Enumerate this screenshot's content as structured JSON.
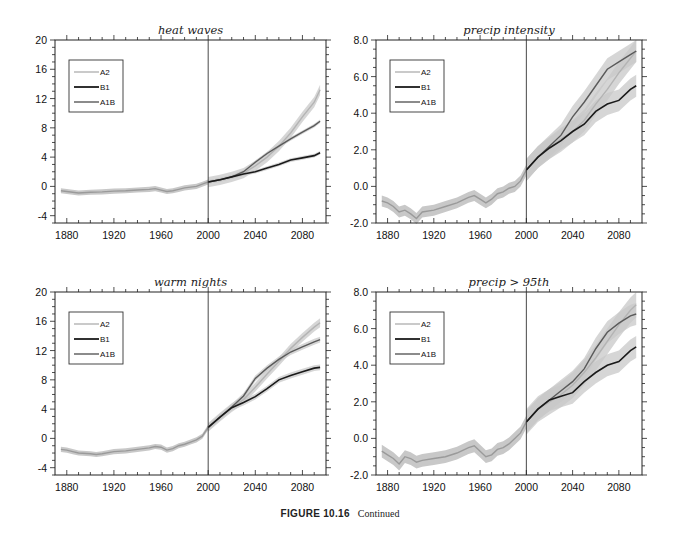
{
  "figure": {
    "caption_label": "FIGURE 10.16",
    "caption_text": "Continued"
  },
  "colors": {
    "A2": "#b4b4b4",
    "B1": "#1a1a1a",
    "A1B": "#5a5a5a",
    "historical": "#9a9a9a",
    "band": "#c8c8c8",
    "axis": "#222222"
  },
  "chart_data": [
    {
      "type": "line",
      "title": "heat waves",
      "xlabel": "",
      "ylabel": "",
      "xlim": [
        1870,
        2100
      ],
      "ylim": [
        -5,
        20
      ],
      "xticks": [
        1880,
        1920,
        1960,
        2000,
        2040,
        2080
      ],
      "yticks": [
        -4,
        0,
        4,
        8,
        12,
        16,
        20
      ],
      "ytick_labels": [
        "-4",
        "0",
        "4",
        "8",
        "12",
        "16",
        "20"
      ],
      "vline": 2000,
      "legend": [
        "A2",
        "B1",
        "A1B"
      ],
      "legend_position": "upper left",
      "band_width": 0.35,
      "historical": {
        "x": [
          1875,
          1880,
          1885,
          1890,
          1900,
          1910,
          1920,
          1930,
          1940,
          1950,
          1955,
          1960,
          1965,
          1970,
          1975,
          1980,
          1985,
          1990,
          1995,
          2000
        ],
        "y": [
          -0.6,
          -0.7,
          -0.8,
          -0.9,
          -0.8,
          -0.75,
          -0.65,
          -0.6,
          -0.5,
          -0.4,
          -0.3,
          -0.5,
          -0.7,
          -0.6,
          -0.4,
          -0.2,
          -0.1,
          0.0,
          0.3,
          0.6
        ]
      },
      "series": [
        {
          "name": "A2",
          "x": [
            2000,
            2010,
            2020,
            2030,
            2040,
            2050,
            2060,
            2070,
            2080,
            2090,
            2095
          ],
          "y": [
            0.6,
            0.9,
            1.3,
            1.8,
            2.8,
            4.0,
            5.5,
            7.3,
            9.5,
            11.5,
            13.2
          ],
          "band": 0.7
        },
        {
          "name": "B1",
          "x": [
            2000,
            2010,
            2020,
            2030,
            2040,
            2050,
            2060,
            2070,
            2080,
            2090,
            2095
          ],
          "y": [
            0.6,
            0.9,
            1.3,
            1.7,
            2.0,
            2.5,
            3.0,
            3.6,
            3.9,
            4.2,
            4.6
          ],
          "band": 0.25
        },
        {
          "name": "A1B",
          "x": [
            2000,
            2010,
            2020,
            2030,
            2040,
            2050,
            2060,
            2070,
            2080,
            2090,
            2095
          ],
          "y": [
            0.6,
            0.9,
            1.3,
            2.0,
            3.3,
            4.5,
            5.5,
            6.5,
            7.4,
            8.3,
            8.9
          ],
          "band": 0.25
        }
      ]
    },
    {
      "type": "line",
      "title": "precip intensity",
      "xlabel": "",
      "ylabel": "",
      "xlim": [
        1870,
        2100
      ],
      "ylim": [
        -2,
        8
      ],
      "xticks": [
        1880,
        1920,
        1960,
        2000,
        2040,
        2080
      ],
      "yticks": [
        -2,
        0,
        2,
        4,
        6,
        8
      ],
      "ytick_labels": [
        "-2.0",
        "0.0",
        "2.0",
        "4.0",
        "6.0",
        "8.0"
      ],
      "vline": 2000,
      "legend": [
        "A2",
        "B1",
        "A1B"
      ],
      "legend_position": "upper left",
      "band_width": 0.3,
      "historical": {
        "x": [
          1875,
          1880,
          1885,
          1890,
          1895,
          1900,
          1905,
          1910,
          1920,
          1930,
          1940,
          1950,
          1955,
          1960,
          1965,
          1970,
          1975,
          1980,
          1985,
          1990,
          1995,
          2000
        ],
        "y": [
          -0.8,
          -0.9,
          -1.1,
          -1.4,
          -1.3,
          -1.5,
          -1.75,
          -1.4,
          -1.3,
          -1.1,
          -0.9,
          -0.6,
          -0.5,
          -0.7,
          -0.9,
          -0.7,
          -0.4,
          -0.3,
          -0.1,
          0.0,
          0.3,
          0.9
        ]
      },
      "series": [
        {
          "name": "A2",
          "x": [
            2000,
            2010,
            2020,
            2030,
            2040,
            2050,
            2060,
            2070,
            2080,
            2090,
            2095
          ],
          "y": [
            0.9,
            1.6,
            2.1,
            2.6,
            3.0,
            3.6,
            4.5,
            5.3,
            6.2,
            7.0,
            7.4
          ],
          "band": 0.6
        },
        {
          "name": "B1",
          "x": [
            2000,
            2010,
            2020,
            2030,
            2040,
            2050,
            2060,
            2070,
            2080,
            2090,
            2095
          ],
          "y": [
            0.9,
            1.6,
            2.1,
            2.5,
            3.0,
            3.4,
            4.1,
            4.5,
            4.7,
            5.3,
            5.5
          ],
          "band": 0.6
        },
        {
          "name": "A1B",
          "x": [
            2000,
            2010,
            2020,
            2030,
            2040,
            2050,
            2060,
            2070,
            2080,
            2090,
            2095
          ],
          "y": [
            0.9,
            1.6,
            2.2,
            2.8,
            3.8,
            4.6,
            5.5,
            6.4,
            6.8,
            7.2,
            7.4
          ],
          "band": 0.6
        }
      ]
    },
    {
      "type": "line",
      "title": "warm nights",
      "xlabel": "",
      "ylabel": "",
      "xlim": [
        1870,
        2100
      ],
      "ylim": [
        -5,
        20
      ],
      "xticks": [
        1880,
        1920,
        1960,
        2000,
        2040,
        2080
      ],
      "yticks": [
        -4,
        0,
        4,
        8,
        12,
        16,
        20
      ],
      "ytick_labels": [
        "-4",
        "0",
        "4",
        "8",
        "12",
        "16",
        "20"
      ],
      "vline": 2000,
      "legend": [
        "A2",
        "B1",
        "A1B"
      ],
      "legend_position": "upper left",
      "band_width": 0.35,
      "historical": {
        "x": [
          1875,
          1880,
          1885,
          1890,
          1900,
          1905,
          1910,
          1920,
          1930,
          1940,
          1950,
          1955,
          1960,
          1965,
          1970,
          1975,
          1980,
          1985,
          1990,
          1995,
          2000
        ],
        "y": [
          -1.5,
          -1.6,
          -1.8,
          -2.0,
          -2.1,
          -2.2,
          -2.1,
          -1.8,
          -1.7,
          -1.5,
          -1.3,
          -1.1,
          -1.2,
          -1.6,
          -1.4,
          -1.0,
          -0.8,
          -0.5,
          -0.2,
          0.3,
          1.5
        ]
      },
      "series": [
        {
          "name": "A2",
          "x": [
            2000,
            2010,
            2020,
            2030,
            2040,
            2050,
            2060,
            2070,
            2080,
            2090,
            2095
          ],
          "y": [
            1.5,
            2.9,
            4.2,
            5.3,
            7.0,
            8.8,
            10.5,
            12.3,
            13.8,
            15.2,
            15.8
          ],
          "band": 0.6
        },
        {
          "name": "B1",
          "x": [
            2000,
            2010,
            2020,
            2030,
            2040,
            2050,
            2060,
            2070,
            2080,
            2090,
            2095
          ],
          "y": [
            1.5,
            2.9,
            4.2,
            4.9,
            5.7,
            6.8,
            8.0,
            8.6,
            9.1,
            9.6,
            9.7
          ],
          "band": 0.4
        },
        {
          "name": "A1B",
          "x": [
            2000,
            2010,
            2020,
            2030,
            2040,
            2050,
            2060,
            2070,
            2080,
            2090,
            2095
          ],
          "y": [
            1.5,
            2.9,
            4.3,
            5.8,
            8.2,
            9.6,
            10.8,
            11.8,
            12.5,
            13.2,
            13.5
          ],
          "band": 0.4
        }
      ]
    },
    {
      "type": "line",
      "title": "precip > 95th",
      "xlabel": "",
      "ylabel": "",
      "xlim": [
        1870,
        2100
      ],
      "ylim": [
        -2,
        8
      ],
      "xticks": [
        1880,
        1920,
        1960,
        2000,
        2040,
        2080
      ],
      "yticks": [
        -2,
        0,
        2,
        4,
        6,
        8
      ],
      "ytick_labels": [
        "-2.0",
        "0.0",
        "2.0",
        "4.0",
        "6.0",
        "8.0"
      ],
      "vline": 2000,
      "legend": [
        "A2",
        "B1",
        "A1B"
      ],
      "legend_position": "upper left",
      "band_width": 0.35,
      "historical": {
        "x": [
          1875,
          1880,
          1885,
          1890,
          1895,
          1900,
          1905,
          1910,
          1920,
          1930,
          1940,
          1950,
          1955,
          1960,
          1965,
          1970,
          1975,
          1980,
          1985,
          1990,
          1995,
          2000
        ],
        "y": [
          -0.7,
          -0.9,
          -1.1,
          -1.4,
          -1.0,
          -1.1,
          -1.3,
          -1.2,
          -1.1,
          -1.0,
          -0.8,
          -0.5,
          -0.4,
          -0.7,
          -1.0,
          -0.9,
          -0.6,
          -0.5,
          -0.3,
          0.0,
          0.3,
          0.9
        ]
      },
      "series": [
        {
          "name": "A2",
          "x": [
            2000,
            2010,
            2020,
            2030,
            2040,
            2050,
            2060,
            2070,
            2080,
            2090,
            2095
          ],
          "y": [
            0.9,
            1.6,
            2.0,
            2.4,
            2.9,
            3.6,
            4.4,
            5.3,
            6.2,
            7.0,
            7.3
          ],
          "band": 0.7
        },
        {
          "name": "B1",
          "x": [
            2000,
            2010,
            2020,
            2030,
            2040,
            2050,
            2060,
            2070,
            2080,
            2090,
            2095
          ],
          "y": [
            0.9,
            1.6,
            2.1,
            2.3,
            2.5,
            3.1,
            3.6,
            4.0,
            4.2,
            4.8,
            5.0
          ],
          "band": 0.6
        },
        {
          "name": "A1B",
          "x": [
            2000,
            2010,
            2020,
            2030,
            2040,
            2050,
            2060,
            2070,
            2080,
            2090,
            2095
          ],
          "y": [
            0.9,
            1.6,
            2.1,
            2.6,
            3.1,
            3.8,
            4.9,
            5.8,
            6.3,
            6.7,
            6.8
          ],
          "band": 0.6
        }
      ]
    }
  ],
  "panels": [
    {
      "title": "heat waves",
      "left": 55,
      "top": 40,
      "width": 271,
      "height": 183
    },
    {
      "title": "precip intensity",
      "left": 376,
      "top": 40,
      "width": 266,
      "height": 183
    },
    {
      "title": "warm nights",
      "left": 55,
      "top": 292,
      "width": 271,
      "height": 183
    },
    {
      "title": "precip > 95th",
      "left": 376,
      "top": 292,
      "width": 266,
      "height": 183
    }
  ]
}
